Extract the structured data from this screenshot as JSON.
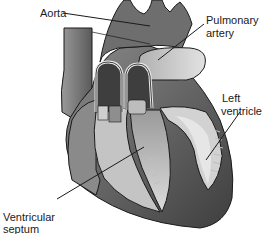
{
  "figure": {
    "labels": {
      "aorta": "Aorta",
      "pulmonary_artery_line1": "Pulmonary",
      "pulmonary_artery_line2": "artery",
      "left_ventricle_line1": "Left",
      "left_ventricle_line2": "ventricle",
      "ventricular_septum_line1": "Ventricular",
      "ventricular_septum_line2": "septum"
    },
    "colors": {
      "background": "#ffffff",
      "outline": "#1a1a1a",
      "dark_tissue": "#4a4a4a",
      "mid_tissue": "#7a7a7a",
      "light_tissue": "#c8c8c8",
      "chamber": "#d9d9d9"
    }
  }
}
